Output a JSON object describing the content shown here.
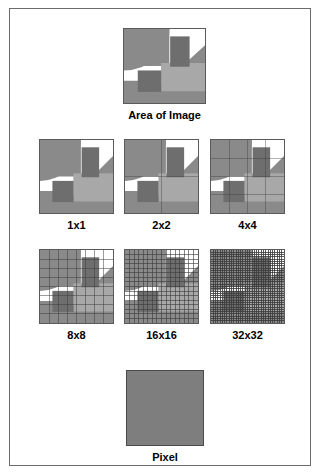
{
  "figure": {
    "title_top": "Area of Image",
    "title_bottom": "Pixel",
    "border_color": "#6b6b6b",
    "background": "#ffffff"
  },
  "palette": {
    "white": "#ffffff",
    "light_gray": "#a8a8a8",
    "mid_gray": "#8a8a8a",
    "dark_gray": "#6e6e6e",
    "outline": "#5a5a5a",
    "grid_line": "#3c3c3c",
    "pixel_swatch": "#7e7e7e",
    "text": "#000000"
  },
  "artwork": {
    "description": "Square image containing a quarter circle, a diagonal band, and two rectangles rendered in three gray tones on white",
    "shapes": [
      {
        "name": "background-plate",
        "fill": "#8a8a8a"
      },
      {
        "name": "white-diagonal-band",
        "fill": "#ffffff"
      },
      {
        "name": "quarter-circle",
        "fill": "#8a8a8a"
      },
      {
        "name": "lower-right-light-block",
        "fill": "#a8a8a8"
      },
      {
        "name": "upper-right-dark-rectangle",
        "fill": "#6e6e6e"
      },
      {
        "name": "lower-left-dark-rectangle",
        "fill": "#6e6e6e"
      }
    ]
  },
  "samples": [
    {
      "id": "area",
      "label": "Area of Image",
      "grid": 0,
      "name": "area-of-image"
    },
    {
      "id": "s1",
      "label": "1x1",
      "grid": 1,
      "name": "sample-1x1"
    },
    {
      "id": "s2",
      "label": "2x2",
      "grid": 2,
      "name": "sample-2x2"
    },
    {
      "id": "s4",
      "label": "4x4",
      "grid": 4,
      "name": "sample-4x4"
    },
    {
      "id": "s8",
      "label": "8x8",
      "grid": 8,
      "name": "sample-8x8"
    },
    {
      "id": "s16",
      "label": "16x16",
      "grid": 16,
      "name": "sample-16x16"
    },
    {
      "id": "s32",
      "label": "32x32",
      "grid": 32,
      "name": "sample-32x32"
    },
    {
      "id": "pixel",
      "label": "Pixel",
      "grid": 0,
      "name": "single-pixel"
    }
  ]
}
